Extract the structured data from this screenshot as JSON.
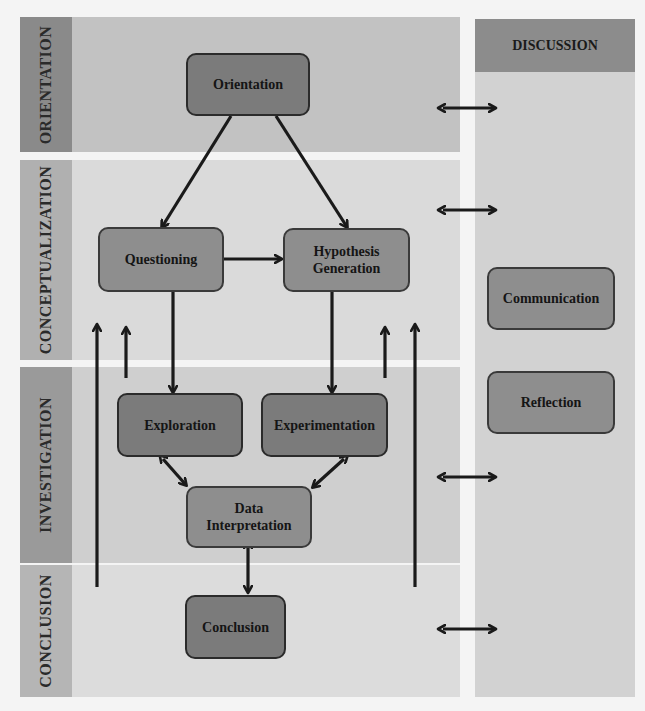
{
  "figure": {
    "phases": [
      {
        "id": "orientation",
        "label": "ORIENTATION"
      },
      {
        "id": "conceptualization",
        "label": "CONCEPTUALIZATION"
      },
      {
        "id": "investigation",
        "label": "INVESTIGATION"
      },
      {
        "id": "conclusion",
        "label": "CONCLUSION"
      }
    ],
    "discussion": {
      "label": "DISCUSSION",
      "subphases": [
        "Communication",
        "Reflection"
      ]
    },
    "nodes": {
      "orientation": "Orientation",
      "questioning": "Questioning",
      "hypothesis_generation_line1": "Hypothesis",
      "hypothesis_generation_line2": "Generation",
      "exploration": "Exploration",
      "experimentation": "Experimentation",
      "data_interpretation_line1": "Data",
      "data_interpretation_line2": "Interpretation",
      "conclusion": "Conclusion",
      "communication": "Communication",
      "reflection": "Reflection"
    },
    "edges": [
      {
        "from": "Orientation",
        "to": "Questioning",
        "type": "directed"
      },
      {
        "from": "Orientation",
        "to": "Hypothesis Generation",
        "type": "directed"
      },
      {
        "from": "Questioning",
        "to": "Hypothesis Generation",
        "type": "directed"
      },
      {
        "from": "Questioning",
        "to": "Exploration",
        "type": "directed"
      },
      {
        "from": "Hypothesis Generation",
        "to": "Experimentation",
        "type": "directed"
      },
      {
        "from": "Exploration",
        "to": "Data Interpretation",
        "type": "bidirectional"
      },
      {
        "from": "Experimentation",
        "to": "Data Interpretation",
        "type": "bidirectional"
      },
      {
        "from": "Data Interpretation",
        "to": "Conclusion",
        "type": "bidirectional"
      },
      {
        "from": "Investigation",
        "to": "Conceptualization",
        "type": "directed",
        "note": "feedback up-arrows (left and right)"
      },
      {
        "from": "Conclusion",
        "to": "Conceptualization",
        "type": "directed",
        "note": "long feedback up-arrows (left and right)"
      },
      {
        "from": "Orientation",
        "to": "Discussion",
        "type": "bidirectional"
      },
      {
        "from": "Conceptualization",
        "to": "Discussion",
        "type": "bidirectional"
      },
      {
        "from": "Investigation",
        "to": "Discussion",
        "type": "bidirectional"
      },
      {
        "from": "Conclusion",
        "to": "Discussion",
        "type": "bidirectional"
      }
    ],
    "colors": {
      "node_fill": "#8e8e8e",
      "node_border": "#3a3a3a",
      "arrow": "#1a1a1a"
    }
  }
}
